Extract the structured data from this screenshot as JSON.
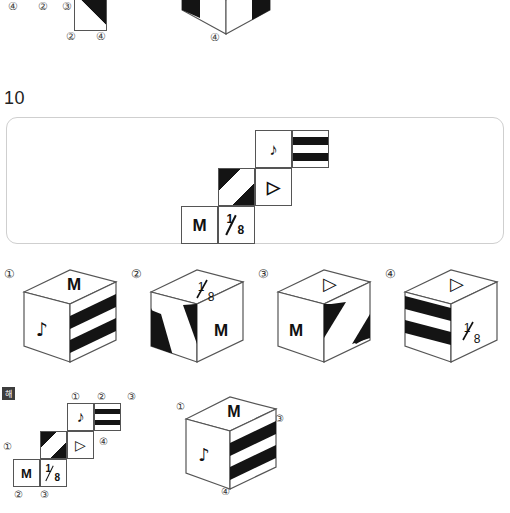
{
  "page": {
    "question_number": "10",
    "explanation_badge": "해"
  },
  "top_remnant": {
    "labels": [
      "④",
      "②",
      "③",
      "②",
      "④",
      "④"
    ]
  },
  "question_net": {
    "faces": [
      {
        "id": "face-note",
        "glyph": "♪",
        "type": "symbol"
      },
      {
        "id": "face-stripes",
        "glyph": "",
        "type": "stripes"
      },
      {
        "id": "face-triangle",
        "glyph": "▷",
        "type": "symbol"
      },
      {
        "id": "face-diagonal",
        "glyph": "",
        "type": "diagonal"
      },
      {
        "id": "face-m",
        "glyph": "M",
        "type": "letter"
      },
      {
        "id": "face-fraction",
        "glyph": "1/8",
        "type": "fraction",
        "numerator": "1",
        "denominator": "8"
      }
    ]
  },
  "options": [
    {
      "number": "①",
      "top_face": "M",
      "left_face": "♪",
      "right_face": "stripes"
    },
    {
      "number": "②",
      "top_face": "1/8",
      "left_face": "diagonal",
      "right_face": "M"
    },
    {
      "number": "③",
      "top_face": "▷",
      "left_face": "M",
      "right_face": "diagonal"
    },
    {
      "number": "④",
      "top_face": "▷",
      "left_face": "stripes",
      "right_face": "1/8"
    }
  ],
  "explanation": {
    "net_labels_top": [
      "①",
      "②",
      "③"
    ],
    "net_label_mid": "④",
    "net_label_left": "①",
    "net_labels_bottom": [
      "②",
      "③"
    ],
    "cube_labels": [
      "①",
      "②",
      "③",
      "④"
    ],
    "cube": {
      "top_face": "M",
      "left_face": "♪",
      "right_face": "stripes"
    }
  },
  "symbols": {
    "music_note": "♪",
    "triangle": "▷",
    "letter_m": "M",
    "fraction_numerator": "1",
    "fraction_denominator": "8"
  },
  "colors": {
    "ink": "#141414",
    "line": "#555555",
    "panel_border": "#cfcfcf",
    "label": "#333333"
  }
}
